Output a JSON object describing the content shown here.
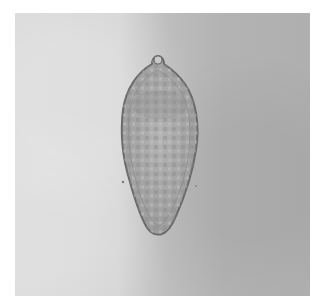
{
  "figure": {
    "type": "micrograph",
    "background_colors": {
      "left": "#dadada",
      "right": "#afafaf"
    },
    "specimen_colors": {
      "outline": "#6e6e6e",
      "interior": "#a9a9a9",
      "granules": "#8a8a8a"
    },
    "caption": ""
  }
}
